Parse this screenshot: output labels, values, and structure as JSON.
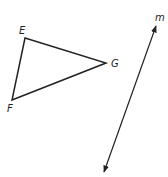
{
  "diagram": {
    "stroke_color": "#222222",
    "triangle": {
      "vertices": [
        {
          "name": "E",
          "label": "E",
          "x": 25,
          "y": 38,
          "label_x": 19,
          "label_y": 34
        },
        {
          "name": "G",
          "label": "G",
          "x": 106,
          "y": 63,
          "label_x": 111,
          "label_y": 67
        },
        {
          "name": "F",
          "label": "F",
          "x": 12,
          "y": 100,
          "label_x": 7,
          "label_y": 112
        }
      ]
    },
    "line": {
      "name": "m",
      "label": "m",
      "x1": 156,
      "y1": 26,
      "x2": 104,
      "y2": 172,
      "label_x": 155,
      "label_y": 21,
      "arrows": "both"
    }
  }
}
